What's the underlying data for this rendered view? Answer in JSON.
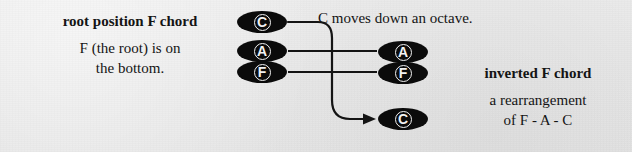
{
  "figure": {
    "background_color": "#e9e9e9",
    "ink_color": "#0b0b0b"
  },
  "left_block": {
    "heading": "root position F chord",
    "line1": "F (the root) is on",
    "line2": "the bottom."
  },
  "caption": {
    "text": "C moves down an octave."
  },
  "right_block": {
    "heading": "inverted F chord",
    "line1": "a rearrangement",
    "line2": "of F - A - C"
  },
  "left_stack": {
    "title": "root position F chord notes",
    "notes": [
      {
        "letter": "C",
        "role": "fifth"
      },
      {
        "letter": "A",
        "role": "third"
      },
      {
        "letter": "F",
        "role": "root"
      }
    ]
  },
  "right_stack": {
    "title": "inverted F chord notes",
    "notes": [
      {
        "letter": "A",
        "role": "lowest"
      },
      {
        "letter": "F",
        "role": "middle"
      },
      {
        "letter": "C",
        "role": "highest-moved-down"
      }
    ]
  },
  "connectors": [
    {
      "name": "a-straight-line",
      "from": "left A",
      "to": "right A",
      "style": "straight",
      "arrow": false
    },
    {
      "name": "f-straight-line",
      "from": "left F",
      "to": "right F",
      "style": "straight",
      "arrow": false
    },
    {
      "name": "c-curved-arrow",
      "from": "left C",
      "to": "right C",
      "style": "curved",
      "arrow": true
    }
  ]
}
